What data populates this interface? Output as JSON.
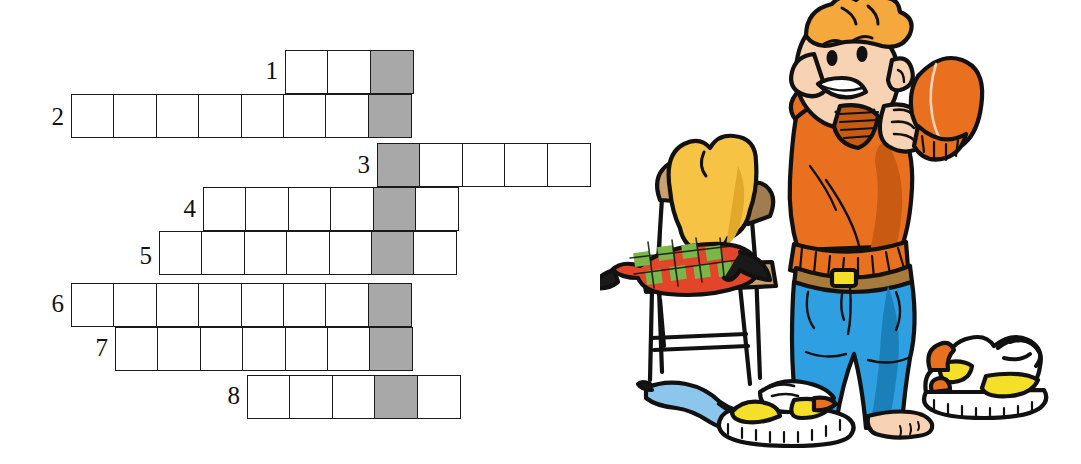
{
  "page": {
    "type": "worksheet-crossword-with-illustration",
    "background": "#ffffff"
  },
  "crossword": {
    "cell_size": 44,
    "grid_origin": {
      "x": 71,
      "y": 50
    },
    "border_color": "#1a1a1a",
    "cell_fill": "#ffffff",
    "shaded_fill": "#a8a8a8",
    "shaded_column_index": 7,
    "rows": [
      {
        "number": "1",
        "y": 50,
        "x": 285,
        "cells": 3,
        "shaded_at": 2
      },
      {
        "number": "2",
        "y": 94,
        "x": 71,
        "cells": 8,
        "shaded_at": 7
      },
      {
        "number": "3",
        "y": 143,
        "x": 377,
        "cells": 5,
        "shaded_at": 0
      },
      {
        "number": "4",
        "y": 187,
        "x": 203,
        "cells": 6,
        "shaded_at": 4
      },
      {
        "number": "5",
        "y": 231,
        "x": 159,
        "cells": 7,
        "shaded_at": 5
      },
      {
        "number": "6",
        "y": 283,
        "x": 71,
        "cells": 8,
        "shaded_at": 7
      },
      {
        "number": "7",
        "y": 327,
        "x": 115,
        "cells": 7,
        "shaded_at": 6
      },
      {
        "number": "8",
        "y": 375,
        "x": 247,
        "cells": 5,
        "shaded_at": 3
      }
    ],
    "numbers": [
      {
        "label": "1",
        "x": 252,
        "y": 58
      },
      {
        "label": "2",
        "x": 38,
        "y": 104
      },
      {
        "label": "3",
        "x": 344,
        "y": 152
      },
      {
        "label": "4",
        "x": 170,
        "y": 196
      },
      {
        "label": "5",
        "x": 126,
        "y": 243
      },
      {
        "label": "6",
        "x": 38,
        "y": 291
      },
      {
        "label": "7",
        "x": 82,
        "y": 335
      },
      {
        "label": "8",
        "x": 214,
        "y": 383
      }
    ]
  },
  "illustration": {
    "description": "Cartoon boy pulling on an orange sweater, standing beside a wooden chair with clothes draped over it; a blue sock and a sneaker lie on the floor.",
    "elements": [
      {
        "name": "boy",
        "detail": "blond-orange haired boy wearing an orange sweater and blue jeans with a brown belt; one foot in a white-yellow sneaker, the other bare"
      },
      {
        "name": "sweater-in-hand",
        "detail": "orange knit sleeve held up near shoulder"
      },
      {
        "name": "wooden-chair",
        "detail": "light brown wooden chair"
      },
      {
        "name": "yellow-garment",
        "detail": "yellow-orange jumper draped over the chair back"
      },
      {
        "name": "plaid-garment",
        "detail": "red and green checked shirt over the chair seat"
      },
      {
        "name": "blue-sock",
        "detail": "light blue sock on the floor"
      },
      {
        "name": "sneaker",
        "detail": "white sneaker with yellow sole accents and orange trim, laces untied"
      }
    ],
    "colors": {
      "skin": "#f7d3b4",
      "skin_shadow": "#e8b894",
      "hair": "#f5a83c",
      "sweater": "#e8701f",
      "sweater_dark": "#c85a12",
      "jeans": "#2e9fe0",
      "jeans_dark": "#1b7fba",
      "belt": "#a67b3c",
      "wood": "#c9a070",
      "wood_dark": "#a07c4e",
      "yellow_garment": "#f6c344",
      "plaid_red": "#e2452a",
      "plaid_green": "#7ab648",
      "sock_blue": "#8dc6ec",
      "shoe_yellow": "#f4e028",
      "shoe_orange": "#e8701f",
      "outline": "#111111"
    }
  }
}
